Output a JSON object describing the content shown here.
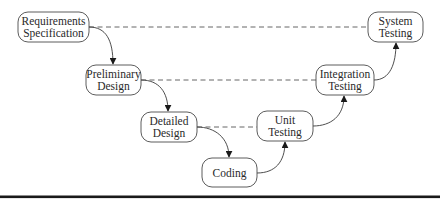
{
  "diagram": {
    "nodes": [
      {
        "id": "req",
        "lines": [
          "Requirements",
          "Specification"
        ]
      },
      {
        "id": "pre",
        "lines": [
          "Preliminary",
          "Design"
        ]
      },
      {
        "id": "det",
        "lines": [
          "Detailed",
          "Design"
        ]
      },
      {
        "id": "cod",
        "lines": [
          "Coding"
        ]
      },
      {
        "id": "uni",
        "lines": [
          "Unit",
          "Testing"
        ]
      },
      {
        "id": "int",
        "lines": [
          "Integration",
          "Testing"
        ]
      },
      {
        "id": "sys",
        "lines": [
          "System",
          "Testing"
        ]
      }
    ],
    "flow_edges": [
      {
        "from": "req",
        "to": "pre"
      },
      {
        "from": "pre",
        "to": "det"
      },
      {
        "from": "det",
        "to": "cod"
      },
      {
        "from": "cod",
        "to": "uni"
      },
      {
        "from": "uni",
        "to": "int"
      },
      {
        "from": "int",
        "to": "sys"
      }
    ],
    "verification_links": [
      {
        "from": "req",
        "to": "sys"
      },
      {
        "from": "pre",
        "to": "int"
      },
      {
        "from": "det",
        "to": "uni"
      }
    ]
  }
}
